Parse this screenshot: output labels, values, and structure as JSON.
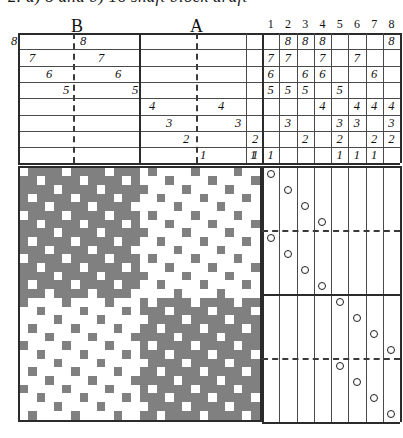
{
  "caption": {
    "text": "2. a) 8 and b) 16 shaft block draft"
  },
  "sections": [
    {
      "label": "B",
      "x": 71,
      "y": 16
    },
    {
      "label": "A",
      "x": 190,
      "y": 16
    }
  ],
  "shaft_numbers": {
    "label": "shaft-numbers",
    "values": [
      "1",
      "2",
      "3",
      "4",
      "5",
      "6",
      "7",
      "8"
    ]
  },
  "colors": {
    "warp_down": "#808080",
    "warp_up": "#ffffff",
    "rule": "#4a4a4a",
    "rule_strong": "#2b2b2b",
    "ink": "#111111"
  },
  "threading": {
    "name": "threading-draft",
    "rows": 8,
    "row_labels": [
      "8",
      "7",
      "6",
      "5",
      "4",
      "3",
      "2",
      "1"
    ],
    "block_b": {
      "label": "B",
      "entries": [
        {
          "row": 0,
          "value": "8",
          "x": 8
        },
        {
          "row": 0,
          "value": "8",
          "x": 77
        },
        {
          "row": 1,
          "value": "7",
          "x": 26
        },
        {
          "row": 1,
          "value": "7",
          "x": 95
        },
        {
          "row": 2,
          "value": "6",
          "x": 43
        },
        {
          "row": 2,
          "value": "6",
          "x": 112
        },
        {
          "row": 3,
          "value": "5",
          "x": 60
        },
        {
          "row": 3,
          "value": "5",
          "x": 129
        }
      ]
    },
    "block_a": {
      "label": "A",
      "entries": [
        {
          "row": 4,
          "value": "4",
          "x": 146
        },
        {
          "row": 4,
          "value": "4",
          "x": 215
        },
        {
          "row": 5,
          "value": "3",
          "x": 163
        },
        {
          "row": 5,
          "value": "3",
          "x": 232
        },
        {
          "row": 6,
          "value": "2",
          "x": 180
        },
        {
          "row": 6,
          "value": "2",
          "x": 249
        },
        {
          "row": 7,
          "value": "1",
          "x": 197
        },
        {
          "row": 7,
          "value": "1",
          "x": 249
        }
      ]
    }
  },
  "tieup": {
    "name": "tie-up-grid",
    "columns": 8,
    "rows": 8,
    "cells": [
      {
        "row": 0,
        "col": 1,
        "value": "8"
      },
      {
        "row": 0,
        "col": 2,
        "value": "8"
      },
      {
        "row": 0,
        "col": 3,
        "value": "8"
      },
      {
        "row": 0,
        "col": 7,
        "value": "8"
      },
      {
        "row": 1,
        "col": 0,
        "value": "7"
      },
      {
        "row": 1,
        "col": 1,
        "value": "7"
      },
      {
        "row": 1,
        "col": 3,
        "value": "7"
      },
      {
        "row": 1,
        "col": 5,
        "value": "7"
      },
      {
        "row": 2,
        "col": 0,
        "value": "6"
      },
      {
        "row": 2,
        "col": 2,
        "value": "6"
      },
      {
        "row": 2,
        "col": 3,
        "value": "6"
      },
      {
        "row": 2,
        "col": 6,
        "value": "6"
      },
      {
        "row": 3,
        "col": 0,
        "value": "5"
      },
      {
        "row": 3,
        "col": 1,
        "value": "5"
      },
      {
        "row": 3,
        "col": 2,
        "value": "5"
      },
      {
        "row": 3,
        "col": 4,
        "value": "5"
      },
      {
        "row": 4,
        "col": 3,
        "value": "4"
      },
      {
        "row": 4,
        "col": 5,
        "value": "4"
      },
      {
        "row": 4,
        "col": 6,
        "value": "4"
      },
      {
        "row": 4,
        "col": 7,
        "value": "4"
      },
      {
        "row": 5,
        "col": 1,
        "value": "3"
      },
      {
        "row": 5,
        "col": 4,
        "value": "3"
      },
      {
        "row": 5,
        "col": 5,
        "value": "3"
      },
      {
        "row": 5,
        "col": 7,
        "value": "3"
      },
      {
        "row": 6,
        "col": 2,
        "value": "2"
      },
      {
        "row": 6,
        "col": 4,
        "value": "2"
      },
      {
        "row": 6,
        "col": 6,
        "value": "2"
      },
      {
        "row": 6,
        "col": 7,
        "value": "2"
      },
      {
        "row": 7,
        "col": 0,
        "value": "1"
      },
      {
        "row": 7,
        "col": 4,
        "value": "1"
      },
      {
        "row": 7,
        "col": 5,
        "value": "1"
      },
      {
        "row": 7,
        "col": 6,
        "value": "1"
      }
    ],
    "left_edge_cell": {
      "row": 7,
      "value": "1"
    }
  },
  "treadling": {
    "name": "treadling-plan",
    "marker": "circle",
    "picks": [
      {
        "col": 0,
        "pick": 0
      },
      {
        "col": 1,
        "pick": 1
      },
      {
        "col": 2,
        "pick": 2
      },
      {
        "col": 3,
        "pick": 3
      },
      {
        "col": 0,
        "pick": 4
      },
      {
        "col": 1,
        "pick": 5
      },
      {
        "col": 2,
        "pick": 6
      },
      {
        "col": 3,
        "pick": 7
      },
      {
        "col": 4,
        "pick": 8
      },
      {
        "col": 5,
        "pick": 9
      },
      {
        "col": 6,
        "pick": 10
      },
      {
        "col": 7,
        "pick": 11
      },
      {
        "col": 4,
        "pick": 12
      },
      {
        "col": 5,
        "pick": 13
      },
      {
        "col": 6,
        "pick": 14
      },
      {
        "col": 7,
        "pick": 15
      }
    ],
    "dash_rows": [
      4,
      12
    ]
  },
  "drawdown": {
    "name": "drawdown-pattern",
    "cols": 28,
    "rows": 29,
    "cell": 8.7,
    "quadrants": [
      {
        "name": "top-left",
        "ground": "dark",
        "cols": [
          0,
          14
        ],
        "rows": [
          0,
          14
        ]
      },
      {
        "name": "top-right",
        "ground": "light",
        "cols": [
          14,
          28
        ],
        "rows": [
          0,
          14
        ]
      },
      {
        "name": "bottom-left",
        "ground": "light",
        "cols": [
          0,
          14
        ],
        "rows": [
          14,
          29
        ]
      },
      {
        "name": "bottom-right",
        "ground": "dark",
        "cols": [
          14,
          28
        ],
        "rows": [
          14,
          29
        ]
      }
    ],
    "satin_step": 3,
    "satin_unit": 5
  }
}
